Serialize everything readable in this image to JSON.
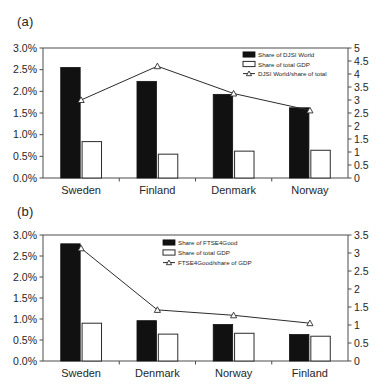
{
  "figure": {
    "panel_a_label": "(a)",
    "panel_b_label": "(b)"
  },
  "chart_data": [
    {
      "id": "a",
      "type": "bar",
      "panel": "(a)",
      "title": "",
      "xlabel": "",
      "ylabel": "",
      "categories": [
        "Sweden",
        "Finland",
        "Denmark",
        "Norway"
      ],
      "left_axis": {
        "ylabel": "",
        "ylim": [
          0,
          3.0
        ],
        "ticks": [
          0,
          0.5,
          1.0,
          1.5,
          2.0,
          2.5,
          3.0
        ],
        "tick_labels": [
          "0.0%",
          "0.5%",
          "1.0%",
          "1.5%",
          "2.0%",
          "2.5%",
          "3.0%"
        ],
        "unit": "%"
      },
      "right_axis": {
        "ylabel": "",
        "ylim": [
          0,
          5
        ],
        "ticks": [
          0,
          0.5,
          1,
          1.5,
          2,
          2.5,
          3,
          3.5,
          4,
          4.5,
          5
        ],
        "tick_labels": [
          "0",
          "0.5",
          "1",
          "1.5",
          "2",
          "2.5",
          "3",
          "3.5",
          "4",
          "4.5",
          "5"
        ]
      },
      "grid": false,
      "legend_position": "top-right",
      "series": [
        {
          "name": "Share of DJSI World",
          "kind": "bar",
          "style": "filled",
          "axis": "left",
          "values": [
            2.55,
            2.23,
            1.93,
            1.62
          ]
        },
        {
          "name": "Share of total GDP",
          "kind": "bar",
          "style": "hollow",
          "axis": "left",
          "values": [
            0.84,
            0.55,
            0.62,
            0.64
          ]
        },
        {
          "name": "DJSI World/share of total",
          "kind": "line",
          "style": "triangle-marker",
          "axis": "right",
          "values": [
            3.0,
            4.3,
            3.25,
            2.6
          ]
        }
      ]
    },
    {
      "id": "b",
      "type": "bar",
      "panel": "(b)",
      "title": "",
      "xlabel": "",
      "ylabel": "",
      "categories": [
        "Sweden",
        "Denmark",
        "Norway",
        "Finland"
      ],
      "left_axis": {
        "ylabel": "",
        "ylim": [
          0,
          3.0
        ],
        "ticks": [
          0,
          0.5,
          1.0,
          1.5,
          2.0,
          2.5,
          3.0
        ],
        "tick_labels": [
          "0.0%",
          "0.5%",
          "1.0%",
          "1.5%",
          "2.0%",
          "2.5%",
          "3.0%"
        ],
        "unit": "%"
      },
      "right_axis": {
        "ylabel": "",
        "ylim": [
          0,
          3.5
        ],
        "ticks": [
          0,
          0.5,
          1,
          1.5,
          2,
          2.5,
          3,
          3.5
        ],
        "tick_labels": [
          "0",
          "0.5",
          "1",
          "1.5",
          "2",
          "2.5",
          "3",
          "3.5"
        ]
      },
      "grid": false,
      "legend_position": "top-right",
      "series": [
        {
          "name": "Share of FTSE4Good",
          "kind": "bar",
          "style": "filled",
          "axis": "left",
          "values": [
            2.79,
            0.96,
            0.87,
            0.63
          ]
        },
        {
          "name": "Share of total GDP",
          "kind": "bar",
          "style": "hollow",
          "axis": "left",
          "values": [
            0.9,
            0.64,
            0.66,
            0.59
          ]
        },
        {
          "name": "FTSE4Good/share of GDP",
          "kind": "line",
          "style": "triangle-marker",
          "axis": "right",
          "values": [
            3.13,
            1.42,
            1.27,
            1.05
          ]
        }
      ]
    }
  ]
}
